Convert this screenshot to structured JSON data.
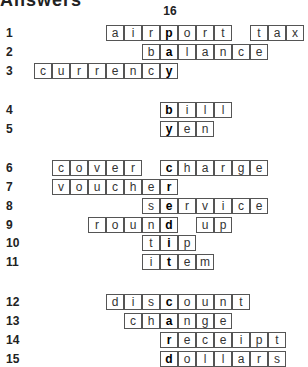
{
  "title": "Answers",
  "hidden_word_number": "16",
  "hidden_word": "pay by credit card",
  "key_column": 0,
  "rows": [
    {
      "num": "1",
      "y": 25,
      "words": [
        {
          "text": "airport",
          "start": -3
        },
        {
          "text": "tax",
          "start": 5
        }
      ],
      "key_index": 3
    },
    {
      "num": "2",
      "y": 44,
      "words": [
        {
          "text": "balance",
          "start": -1
        }
      ],
      "key_index": 1
    },
    {
      "num": "3",
      "y": 63,
      "words": [
        {
          "text": "currency",
          "start": -7
        }
      ],
      "key_index": 7
    },
    {
      "num": "4",
      "y": 102,
      "words": [
        {
          "text": "bill",
          "start": 0
        }
      ],
      "key_index": 0
    },
    {
      "num": "5",
      "y": 121,
      "words": [
        {
          "text": "yen",
          "start": 0
        }
      ],
      "key_index": 0
    },
    {
      "num": "6",
      "y": 160,
      "words": [
        {
          "text": "cover",
          "start": -6
        },
        {
          "text": "charge",
          "start": 0
        }
      ],
      "key_index": 0
    },
    {
      "num": "7",
      "y": 179,
      "words": [
        {
          "text": "voucher",
          "start": -6
        }
      ],
      "key_index": 6
    },
    {
      "num": "8",
      "y": 198,
      "words": [
        {
          "text": "service",
          "start": -1
        }
      ],
      "key_index": 1
    },
    {
      "num": "9",
      "y": 217,
      "words": [
        {
          "text": "round",
          "start": -4
        },
        {
          "text": "up",
          "start": 2
        }
      ],
      "key_index": 4
    },
    {
      "num": "10",
      "y": 235,
      "words": [
        {
          "text": "tip",
          "start": -1
        }
      ],
      "key_index": 1
    },
    {
      "num": "11",
      "y": 254,
      "words": [
        {
          "text": "item",
          "start": -1
        }
      ],
      "key_index": 1
    },
    {
      "num": "12",
      "y": 294,
      "words": [
        {
          "text": "discount",
          "start": -3
        }
      ],
      "key_index": 3
    },
    {
      "num": "13",
      "y": 313,
      "words": [
        {
          "text": "change",
          "start": -2
        }
      ],
      "key_index": 2
    },
    {
      "num": "14",
      "y": 332,
      "words": [
        {
          "text": "receipt",
          "start": 0
        }
      ],
      "key_index": 0
    },
    {
      "num": "15",
      "y": 351,
      "words": [
        {
          "text": "dollars",
          "start": 0
        }
      ],
      "key_index": 0
    }
  ]
}
